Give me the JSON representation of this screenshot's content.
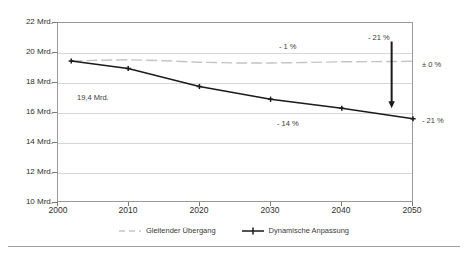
{
  "chart_data": {
    "type": "line",
    "title": "",
    "subtitle": "",
    "xlabel": "",
    "ylabel": "",
    "xlim": [
      2000,
      2050
    ],
    "ylim": [
      10,
      22
    ],
    "xticks": [
      2000,
      2010,
      2020,
      2030,
      2040,
      2050
    ],
    "xticklabels": [
      "2000",
      "2010",
      "2020",
      "2030",
      "2040",
      "2050"
    ],
    "yticks": [
      10,
      12,
      14,
      16,
      18,
      20,
      22
    ],
    "yticklabels": [
      "10 Mrd.",
      "12 Mrd.",
      "14 Mrd.",
      "16 Mrd.",
      "18 Mrd.",
      "20 Mrd.",
      "22 Mrd."
    ],
    "grid": true,
    "legend_position": "bottom-center",
    "units": "Mrd.",
    "series": [
      {
        "name": "Gleitender Übergang",
        "style": "dashed",
        "color": "#c4c4c4",
        "marker": "none",
        "x": [
          2002,
          2006,
          2010,
          2015,
          2020,
          2025,
          2030,
          2035,
          2040,
          2045,
          2050
        ],
        "values": [
          19.4,
          19.45,
          19.48,
          19.42,
          19.32,
          19.27,
          19.27,
          19.3,
          19.35,
          19.36,
          19.38
        ]
      },
      {
        "name": "Dynamische Anpassung",
        "style": "solid",
        "color": "#1a1a1a",
        "marker": "plus",
        "x": [
          2002,
          2010,
          2020,
          2030,
          2040,
          2050
        ],
        "values": [
          19.4,
          18.9,
          17.7,
          16.85,
          16.25,
          15.55
        ]
      }
    ],
    "annotations": [
      {
        "name": "start-value",
        "text": "19,4 Mrd.",
        "x": 2006,
        "y": 17.3
      },
      {
        "name": "gleitender-uebergang-change",
        "text": "- 1 %",
        "x": 2031,
        "y": 20.75
      },
      {
        "name": "dynamische-anpassung-change",
        "text": "- 14 %",
        "x": 2031,
        "y": 15.5
      },
      {
        "name": "gap-arrow-top-label",
        "text": "- 21 %",
        "x": 2047,
        "y": 21.4
      },
      {
        "name": "gleitender-uebergang-endvalue",
        "text": "± 0 %",
        "x": 2054,
        "y": 19.3
      },
      {
        "name": "dynamische-anpassung-endvalue",
        "text": "- 21 %",
        "x": 2054,
        "y": 15.5
      }
    ],
    "arrow": {
      "name": "gap-arrow",
      "x": 2047,
      "y_start": 20.7,
      "y_end": 16.25,
      "direction": "down",
      "color": "#1a1a1a"
    }
  },
  "legend": {
    "items": [
      {
        "label": "Gleitender Übergang",
        "marker": "dashed-line-swatch"
      },
      {
        "label": "Dynamische Anpassung",
        "marker": "solid-line-plus-swatch"
      }
    ]
  },
  "colors": {
    "series_gray": "#c4c4c4",
    "series_black": "#1a1a1a",
    "gridline": "#d8d8d8",
    "frame": "#9a9a9a",
    "text": "#3a3a3a",
    "rule": "#9d9d9d"
  }
}
